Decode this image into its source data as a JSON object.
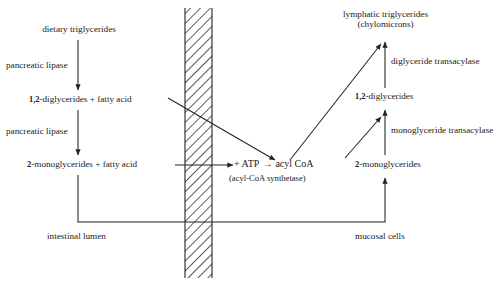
{
  "diagram": {
    "title_semantic": "intestinal-lipid-absorption-pathway",
    "membrane": {
      "name": "intestinal-membrane-hatched-band",
      "fill_color": "#ffffff",
      "hatch_color": "#222222"
    },
    "line_color": "#222222",
    "compartments": {
      "left_label": "intestinal lumen",
      "right_label": "mucosal cells"
    },
    "left_pathway": {
      "node_1": "dietary triglycerides",
      "enzyme_1": "pancreatic lipase",
      "node_2_prefix": "1,2",
      "node_2_rest": "-diglycerides + fatty acid",
      "enzyme_2": "pancreatic lipase",
      "node_3_prefix": "2",
      "node_3_rest": "-monoglycerides + fatty acid"
    },
    "center_reaction": {
      "plus_atp": "+ ATP",
      "arrow": "→",
      "product": "acyl CoA",
      "enzyme": "(acyl-CoA synthetase)"
    },
    "right_pathway": {
      "node_top_line1": "lymphatic triglycerides",
      "node_top_line2": "(chylomicrons)",
      "enzyme_top": "diglyceride transacylase",
      "node_mid_prefix": "1,2",
      "node_mid_rest": "-diglycerides",
      "enzyme_mid": "monoglyceride transacylase",
      "node_bottom_prefix": "2",
      "node_bottom_rest": "-monoglycerides"
    }
  }
}
